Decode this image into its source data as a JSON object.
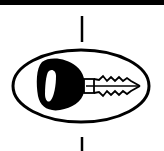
{
  "symbol": {
    "name": "key-in-ellipse",
    "description": "Key symbol enclosed in an ellipse with vertical lines above and below",
    "colors": {
      "foreground": "#000000",
      "background": "#ffffff"
    }
  }
}
